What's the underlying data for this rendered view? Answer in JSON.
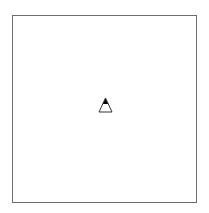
{
  "diagram": {
    "frame": {
      "border_color": "#6e6e6e",
      "background": "#ffffff"
    },
    "marker": {
      "icon": "triangle-icon",
      "fill_top": "#000000",
      "fill_bottom": "#ffffff",
      "stroke": "#333333"
    }
  }
}
